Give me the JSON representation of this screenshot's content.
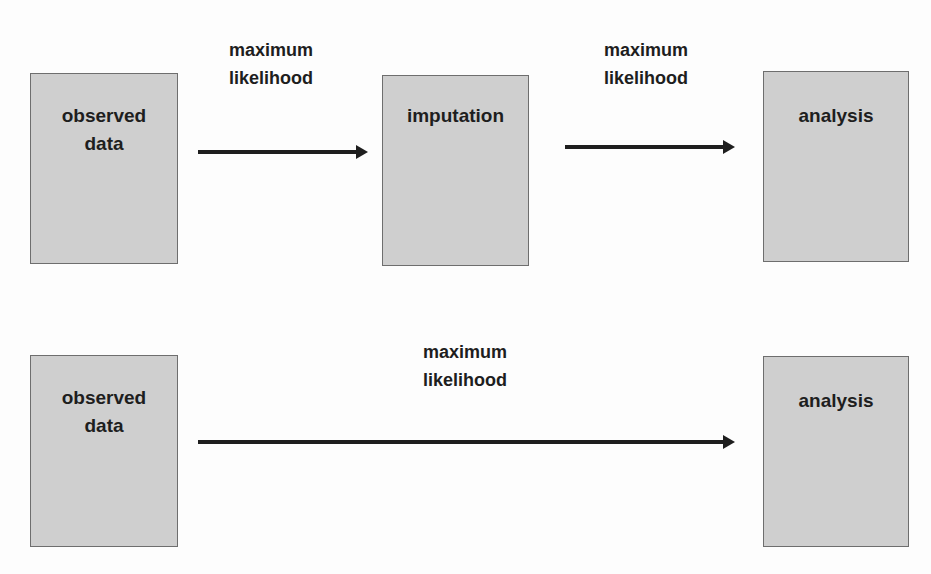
{
  "diagram": {
    "top_row": {
      "nodes": [
        {
          "id": "observed-data",
          "label": "observed\ndata"
        },
        {
          "id": "imputation",
          "label": "imputation"
        },
        {
          "id": "analysis",
          "label": "analysis"
        }
      ],
      "edges": [
        {
          "from": "observed-data",
          "to": "imputation",
          "label": "maximum\nlikelihood"
        },
        {
          "from": "imputation",
          "to": "analysis",
          "label": "maximum\nlikelihood"
        }
      ]
    },
    "bottom_row": {
      "nodes": [
        {
          "id": "observed-data",
          "label": "observed\ndata"
        },
        {
          "id": "analysis",
          "label": "analysis"
        }
      ],
      "edges": [
        {
          "from": "observed-data",
          "to": "analysis",
          "label": "maximum\nlikelihood"
        }
      ]
    },
    "colors": {
      "box_fill": "#cfcfcf",
      "box_border": "#6e6e6e",
      "arrow": "#1e1e1e",
      "text": "#1e1e1e"
    }
  }
}
